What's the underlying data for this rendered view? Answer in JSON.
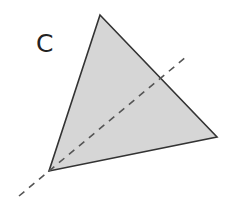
{
  "figure": {
    "label": "C",
    "label_pos": [
      36,
      52
    ],
    "triangle": {
      "vertices": [
        [
          100,
          15
        ],
        [
          217,
          137
        ],
        [
          49,
          171
        ]
      ],
      "fill": "#d6d6d6",
      "stroke": "#333333"
    },
    "dashed_line": {
      "from": [
        19,
        196
      ],
      "to": [
        186,
        57
      ],
      "stroke": "#555555"
    }
  }
}
